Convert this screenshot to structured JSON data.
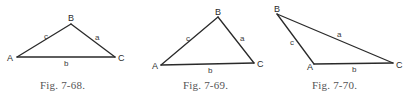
{
  "figures": [
    {
      "caption": "Fig. 7-68.",
      "caption_x": 40,
      "vertices": {
        "A": {
          "label": "A",
          "x": 17,
          "y": 57,
          "lx": 7,
          "ly": 61
        },
        "B": {
          "label": "B",
          "x": 71,
          "y": 24,
          "lx": 68,
          "ly": 21
        },
        "C": {
          "label": "C",
          "x": 115,
          "y": 57,
          "lx": 118,
          "ly": 61
        }
      },
      "sides": {
        "a": {
          "label": "a",
          "x": 95,
          "y": 40
        },
        "b": {
          "label": "b",
          "x": 64,
          "y": 66
        },
        "c": {
          "label": "c",
          "x": 44,
          "y": 39
        }
      }
    },
    {
      "caption": "Fig. 7-69.",
      "caption_x": 183,
      "vertices": {
        "A": {
          "label": "A",
          "x": 161,
          "y": 65,
          "lx": 152,
          "ly": 69
        },
        "B": {
          "label": "B",
          "x": 218,
          "y": 17,
          "lx": 215,
          "ly": 15
        },
        "C": {
          "label": "C",
          "x": 254,
          "y": 63,
          "lx": 257,
          "ly": 67
        }
      },
      "sides": {
        "a": {
          "label": "a",
          "x": 240,
          "y": 41
        },
        "b": {
          "label": "b",
          "x": 208,
          "y": 73
        },
        "c": {
          "label": "c",
          "x": 186,
          "y": 41
        }
      }
    },
    {
      "caption": "Fig. 7-70.",
      "caption_x": 312,
      "vertices": {
        "A": {
          "label": "A",
          "x": 314,
          "y": 64,
          "lx": 307,
          "ly": 70
        },
        "B": {
          "label": "B",
          "x": 277,
          "y": 14,
          "lx": 274,
          "ly": 12
        },
        "C": {
          "label": "C",
          "x": 393,
          "y": 63,
          "lx": 396,
          "ly": 68
        }
      },
      "sides": {
        "a": {
          "label": "a",
          "x": 337,
          "y": 37
        },
        "b": {
          "label": "b",
          "x": 352,
          "y": 72
        },
        "c": {
          "label": "c",
          "x": 290,
          "y": 45
        }
      }
    }
  ]
}
